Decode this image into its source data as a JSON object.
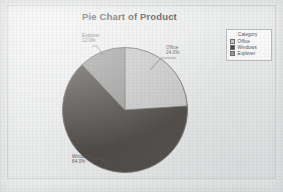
{
  "chart": {
    "title": "Pie Chart of Product",
    "legend_title": "Category"
  },
  "chart_data": {
    "type": "pie",
    "title": "Pie Chart of Product",
    "xlabel": "",
    "ylabel": "",
    "legend_position": "top-right",
    "grid": false,
    "start_angle_deg": 0,
    "direction": "clockwise",
    "categories": [
      "Office",
      "Windows",
      "Explorer"
    ],
    "values": [
      24.0,
      64.0,
      12.0
    ],
    "labels": [
      "24.0%",
      "64.0%",
      "12.0%"
    ],
    "colors": [
      "#c8c8c8",
      "#4a4541",
      "#9a9a98"
    ],
    "slices": [
      {
        "name": "Office",
        "percent": 24.0,
        "label": "24.0%",
        "color": "#c8c8c8"
      },
      {
        "name": "Windows",
        "percent": 64.0,
        "label": "64.0%",
        "color": "#4a4541"
      },
      {
        "name": "Explorer",
        "percent": 12.0,
        "label": "12.0%",
        "color": "#9a9a98"
      }
    ]
  },
  "labels": {
    "office": {
      "name": "Office",
      "pct": "24.0%"
    },
    "windows": {
      "name": "Windows",
      "pct": "64.0%"
    },
    "explorer": {
      "name": "Explorer",
      "pct": "12.0%"
    }
  },
  "legend": {
    "title": "Category",
    "items": [
      {
        "label": "Office",
        "color": "#c8c8c8"
      },
      {
        "label": "Windows",
        "color": "#4a4541"
      },
      {
        "label": "Explorer",
        "color": "#9a9a98"
      }
    ]
  }
}
